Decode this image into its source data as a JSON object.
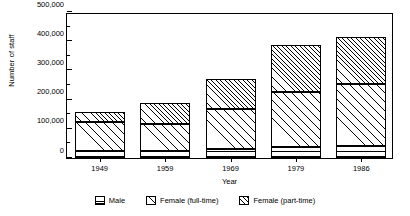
{
  "chart_data": {
    "type": "bar",
    "stacked": true,
    "title": "",
    "xlabel": "Year",
    "ylabel": "Number of staff",
    "categories": [
      "1949",
      "1959",
      "1969",
      "1979",
      "1986"
    ],
    "ylim": [
      0,
      500000
    ],
    "ytick_values": [
      0,
      100000,
      200000,
      300000,
      400000,
      500000
    ],
    "ytick_labels": [
      "0",
      "100,000",
      "200,000",
      "300,000",
      "400,000",
      "500,000"
    ],
    "yminor_values": [
      50000,
      150000,
      250000,
      350000,
      450000
    ],
    "grid": false,
    "legend_position": "below",
    "series": [
      {
        "name": "Male",
        "pattern": "horizontal-lines",
        "values": [
          24000,
          25000,
          30000,
          38000,
          41000
        ]
      },
      {
        "name": "Female (full-time)",
        "pattern": "sparse-diagonal",
        "values": [
          100000,
          92000,
          138000,
          188000,
          212000
        ]
      },
      {
        "name": "Female (part-time)",
        "pattern": "dense-diagonal",
        "values": [
          35000,
          72000,
          103000,
          161000,
          161000
        ]
      }
    ],
    "totals": [
      159000,
      189000,
      271000,
      387000,
      414000
    ]
  },
  "colors": {
    "axis": "#000000",
    "background": "#ffffff",
    "ink": "#000000"
  }
}
